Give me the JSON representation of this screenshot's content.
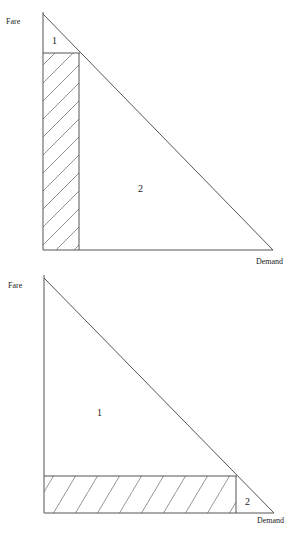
{
  "diagrams": [
    {
      "y_label": "Fare",
      "x_label": "Demand",
      "regions": [
        {
          "id": "1",
          "label": "1",
          "description": "small triangle above the hatched rectangle"
        },
        {
          "id": "2",
          "label": "2",
          "description": "large triangle to the right of the hatched rectangle"
        }
      ],
      "hatched_region": "tall narrow rectangle: high fare, low demand"
    },
    {
      "y_label": "Fare",
      "x_label": "Demand",
      "regions": [
        {
          "id": "1",
          "label": "1",
          "description": "large triangle above the hatched rectangle"
        },
        {
          "id": "2",
          "label": "2",
          "description": "small triangle to the right of the hatched rectangle"
        }
      ],
      "hatched_region": "wide short rectangle: low fare, high demand"
    }
  ],
  "colors": {
    "line": "#555555",
    "hatch": "#777777",
    "text": "#222222"
  }
}
